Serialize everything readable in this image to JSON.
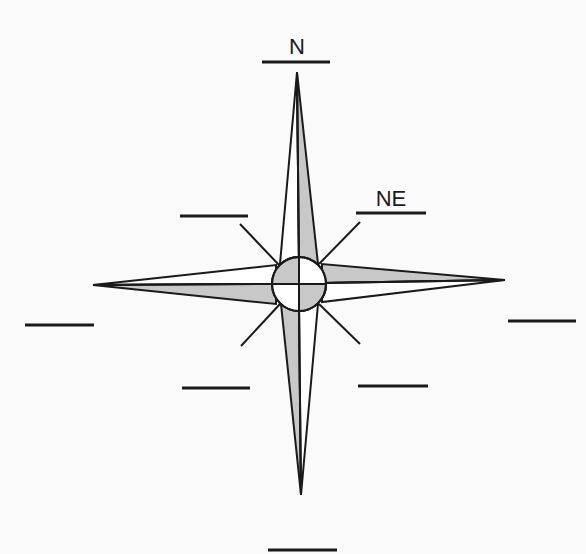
{
  "diagram": {
    "colors": {
      "stroke": "#1a1a1a",
      "shade": "#c8c8c8",
      "paper": "#fafafa",
      "white": "#ffffff"
    },
    "labels": [
      {
        "id": "N",
        "text": "N",
        "filled": true
      },
      {
        "id": "NE",
        "text": "NE",
        "filled": true
      },
      {
        "id": "E",
        "text": "",
        "filled": false
      },
      {
        "id": "SE",
        "text": "",
        "filled": false
      },
      {
        "id": "S",
        "text": "",
        "filled": false
      },
      {
        "id": "SW",
        "text": "",
        "filled": false
      },
      {
        "id": "W",
        "text": "",
        "filled": false
      },
      {
        "id": "NW",
        "text": "",
        "filled": false
      }
    ],
    "points": [
      "North",
      "East",
      "South",
      "West"
    ],
    "intercardinal_ticks": [
      "NE",
      "SE",
      "SW",
      "NW"
    ]
  }
}
